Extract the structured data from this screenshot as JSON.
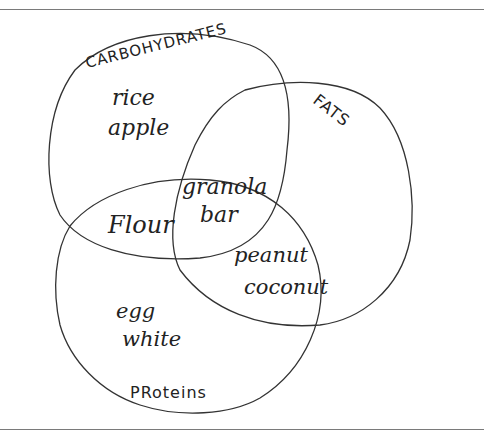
{
  "diagram": {
    "type": "venn",
    "sets": [
      {
        "id": "carbohydrates",
        "label": "CARBOHYDRATES"
      },
      {
        "id": "fats",
        "label": "FATS"
      },
      {
        "id": "proteins",
        "label": "PRoteins"
      }
    ],
    "regions": {
      "carbohydrates_only": [
        "rice",
        "apple"
      ],
      "carbohydrates_proteins": [
        "Flour"
      ],
      "all_three": [
        "granola",
        "bar"
      ],
      "fats_proteins": [
        "peanut",
        "coconut"
      ],
      "proteins_only": [
        "egg",
        "white"
      ],
      "fats_only": []
    },
    "colors": {
      "stroke": "#333333",
      "text": "#222222",
      "frame": "#7a7a7a",
      "background": "#ffffff"
    }
  }
}
